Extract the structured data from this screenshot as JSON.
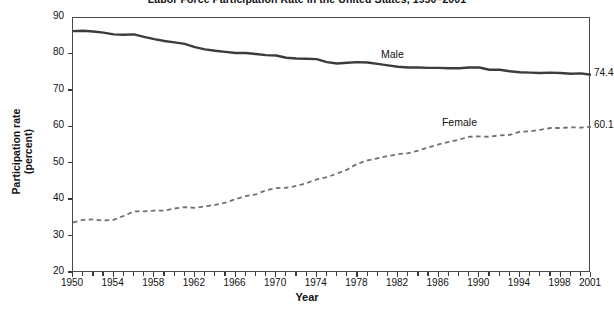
{
  "chart_data": {
    "type": "line",
    "title": "Labor Force Participation Rate in the United States, 1950–2001",
    "xlabel": "Year",
    "ylabel_line1": "Participation rate",
    "ylabel_line2": "(percent)",
    "xlim": [
      1950,
      2001
    ],
    "ylim": [
      20,
      90
    ],
    "grid": false,
    "legend_position": "inline-annotations",
    "y_ticks": [
      20,
      30,
      40,
      50,
      60,
      70,
      80,
      90
    ],
    "x_ticks": [
      1950,
      1954,
      1958,
      1962,
      1966,
      1970,
      1974,
      1978,
      1982,
      1986,
      1990,
      1994,
      1998,
      2001
    ],
    "x": [
      1950,
      1951,
      1952,
      1953,
      1954,
      1955,
      1956,
      1957,
      1958,
      1959,
      1960,
      1961,
      1962,
      1963,
      1964,
      1965,
      1966,
      1967,
      1968,
      1969,
      1970,
      1971,
      1972,
      1973,
      1974,
      1975,
      1976,
      1977,
      1978,
      1979,
      1980,
      1981,
      1982,
      1983,
      1984,
      1985,
      1986,
      1987,
      1988,
      1989,
      1990,
      1991,
      1992,
      1993,
      1994,
      1995,
      1996,
      1997,
      1998,
      1999,
      2000,
      2001
    ],
    "series": [
      {
        "name": "Male",
        "style": "solid",
        "color": "#3c3c3c",
        "end_value": "74.4",
        "label_x": 1982,
        "label_y": 79.5,
        "values": [
          86.4,
          86.5,
          86.3,
          86.0,
          85.5,
          85.4,
          85.5,
          84.8,
          84.2,
          83.7,
          83.3,
          82.9,
          82.0,
          81.4,
          81.0,
          80.7,
          80.4,
          80.4,
          80.1,
          79.8,
          79.7,
          79.1,
          78.9,
          78.8,
          78.7,
          77.9,
          77.5,
          77.7,
          77.9,
          77.8,
          77.4,
          77.0,
          76.6,
          76.4,
          76.4,
          76.3,
          76.3,
          76.2,
          76.2,
          76.4,
          76.4,
          75.8,
          75.8,
          75.4,
          75.1,
          75.0,
          74.9,
          75.0,
          74.9,
          74.7,
          74.8,
          74.4
        ]
      },
      {
        "name": "Female",
        "style": "dashed",
        "color": "#707070",
        "end_value": "60.1",
        "label_x": 1988,
        "label_y": 61.0,
        "values": [
          33.9,
          34.6,
          34.7,
          34.4,
          34.6,
          35.7,
          36.9,
          36.9,
          37.1,
          37.1,
          37.7,
          38.1,
          37.9,
          38.3,
          38.7,
          39.3,
          40.3,
          41.1,
          41.6,
          42.7,
          43.3,
          43.4,
          43.9,
          44.7,
          45.7,
          46.3,
          47.3,
          48.4,
          50.0,
          50.9,
          51.5,
          52.1,
          52.6,
          52.9,
          53.6,
          54.5,
          55.3,
          56.0,
          56.6,
          57.4,
          57.5,
          57.4,
          57.8,
          57.9,
          58.8,
          58.9,
          59.3,
          59.8,
          59.8,
          60.0,
          59.9,
          60.1
        ]
      }
    ]
  }
}
